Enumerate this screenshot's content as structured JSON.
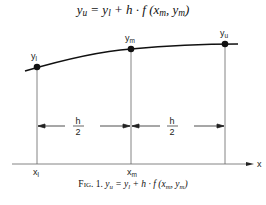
{
  "formula": {
    "lhs": "y",
    "lhs_sub": "u",
    "eq": " = ",
    "t1": "y",
    "t1_sub": "l",
    "plus": " + h · f (x",
    "arg1_sub": "m",
    "comma": ", y",
    "arg2_sub": "m",
    "close": ")"
  },
  "diagram": {
    "points": [
      {
        "label": "y",
        "sub": "l",
        "x_label": "x",
        "x_sub": "l"
      },
      {
        "label": "y",
        "sub": "m",
        "x_label": "x",
        "x_sub": "m"
      },
      {
        "label": "y",
        "sub": "u"
      }
    ],
    "interval_left": {
      "numerator": "h",
      "denominator": "2"
    },
    "interval_right": {
      "numerator": "h",
      "denominator": "2"
    },
    "axis_label": "x"
  },
  "caption": {
    "fig": "Fig. 1.",
    "lhs": "y",
    "lhs_sub": "u",
    "eq": " = ",
    "t1": "y",
    "t1_sub": "l",
    "plus": " + h · f (x",
    "arg1_sub": "m",
    "comma": ", y",
    "arg2_sub": "m",
    "close": ")"
  },
  "colors": {
    "curve": "#111111",
    "guide_lines": "#555555",
    "background": "#ffffff"
  }
}
